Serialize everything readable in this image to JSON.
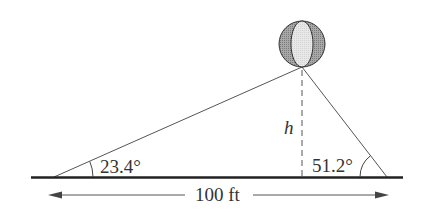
{
  "diagram": {
    "type": "trigonometry-balloon-triangle",
    "labels": {
      "left_angle": "23.4°",
      "right_angle": "51.2°",
      "height": "h",
      "distance": "100 ft"
    },
    "values": {
      "left_angle_deg": 23.4,
      "right_angle_deg": 51.2,
      "baseline_distance_ft": 100
    },
    "colors": {
      "line": "#555555",
      "ground": "#222222",
      "balloon_dark": "#9a9a9a",
      "balloon_light": "#e6e6e6"
    }
  }
}
